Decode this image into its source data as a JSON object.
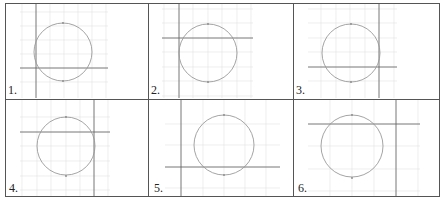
{
  "table": {
    "rows": 2,
    "cols": 3
  },
  "colors": {
    "border": "#555555",
    "grid": "#dedede",
    "axis": "#666666",
    "circle": "#9a9a9a",
    "tick": "#888888"
  },
  "panels": [
    {
      "label": "1.",
      "grid_spacing": 14,
      "axis": {
        "x_y": 68,
        "y_x": 36
      },
      "circle": {
        "cx": 62,
        "cy": 50,
        "r": 24
      },
      "cell": {
        "x": 5,
        "y": 3
      }
    },
    {
      "label": "2.",
      "grid_spacing": 14.5,
      "axis": {
        "x_y": 38,
        "y_x": 178
      },
      "circle": {
        "cx": 208,
        "cy": 38,
        "r": 29
      },
      "cell": {
        "x": 148,
        "y": 3
      }
    },
    {
      "label": "3.",
      "grid_spacing": 14.5,
      "axis": {
        "x_y": 67,
        "y_x": 379
      },
      "circle": {
        "cx": 351,
        "cy": 52,
        "r": 29
      },
      "cell": {
        "x": 293,
        "y": 3
      }
    },
    {
      "label": "4.",
      "grid_spacing": 15,
      "axis": {
        "x_y": 132,
        "y_x": 94
      },
      "circle": {
        "cx": 66,
        "cy": 146,
        "r": 29
      },
      "cell": {
        "x": 5,
        "y": 99
      }
    },
    {
      "label": "5.",
      "grid_spacing": 21,
      "axis": {
        "x_y": 167,
        "y_x": 181
      },
      "circle": {
        "cx": 224,
        "cy": 145,
        "r": 30
      },
      "cell": {
        "x": 148,
        "y": 99
      }
    },
    {
      "label": "6.",
      "grid_spacing": 22,
      "axis": {
        "x_y": 124,
        "y_x": 396
      },
      "circle": {
        "cx": 352,
        "cy": 146,
        "r": 31
      },
      "cell": {
        "x": 293,
        "y": 99
      }
    }
  ]
}
